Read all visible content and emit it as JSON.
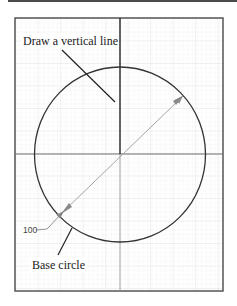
{
  "figure": {
    "labels": {
      "instruction": "Draw a vertical line",
      "base_circle": "Base circle",
      "dimension": "100"
    },
    "geometry": {
      "frame": {
        "x": 15,
        "y": 18,
        "width": 208,
        "height": 273
      },
      "center": {
        "x": 120,
        "y": 154
      },
      "radius": 86,
      "diameter_value": 100
    },
    "colors": {
      "frame": "#555555",
      "grid_minor": "#eeeeee",
      "grid_major": "#dddddd",
      "circle": "#333333",
      "vertical_line": "#222222",
      "axis_line": "#777777",
      "dimension_line": "#9a9a9a",
      "top_bar": "#4a4a4a"
    }
  }
}
